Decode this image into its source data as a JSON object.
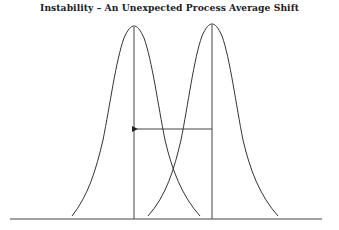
{
  "diagram": {
    "title": "Instability – An Unexpected Process Average Shift",
    "elements": [
      {
        "id": "curve-original",
        "type": "normal-curve",
        "center_x": 134,
        "peak_y": 26,
        "description": "original process distribution"
      },
      {
        "id": "curve-shifted",
        "type": "normal-curve",
        "center_x": 212,
        "peak_y": 24,
        "description": "shifted process distribution"
      },
      {
        "id": "mean-line-original",
        "type": "vertical-line",
        "x": 134
      },
      {
        "id": "mean-line-shifted",
        "type": "vertical-line",
        "x": 212
      },
      {
        "id": "shift-arrow",
        "type": "arrow",
        "from_x": 212,
        "to_x": 136,
        "y": 129,
        "direction": "left"
      },
      {
        "id": "baseline",
        "type": "horizontal-line",
        "y": 219,
        "from_x": 10,
        "to_x": 322
      }
    ],
    "colors": {
      "line": "#333333",
      "background": "#ffffff"
    }
  }
}
